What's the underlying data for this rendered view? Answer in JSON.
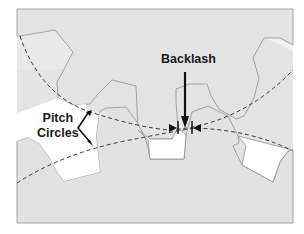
{
  "diagram": {
    "labels": {
      "backlash": "Backlash",
      "pitch_line1": "Pitch",
      "pitch_line2": "Circles"
    },
    "elements": {
      "upper_gear": "gear with teeth pointing downward (top)",
      "lower_gear": "gear with teeth pointing upward (bottom)",
      "pitch_circles": "two dashed arcs crossing at mesh point",
      "backlash_gap": "gap between tooth flanks marked by inward arrows"
    },
    "colors": {
      "gear_fill": "#e6e6e6",
      "gap_fill": "#ffffff",
      "outline": "#8a8a8a",
      "dash": "#333333",
      "arrow": "#111111",
      "text": "#1a1a1a"
    }
  }
}
